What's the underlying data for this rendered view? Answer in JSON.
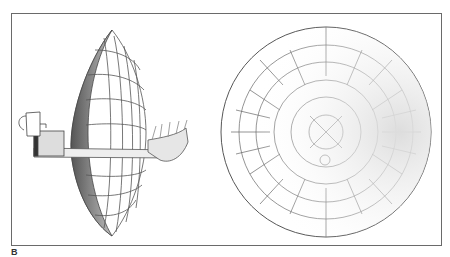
{
  "figure": {
    "panel_label": "B",
    "views": [
      {
        "name": "side-view",
        "description": "Parabolic reflector dish in profile with pot and kettle on boom"
      },
      {
        "name": "front-view",
        "description": "Circular reflector face with radial grid segments"
      }
    ],
    "colors": {
      "ink": "#555555",
      "frame": "#6a6a6a",
      "paper": "#ffffff"
    }
  }
}
